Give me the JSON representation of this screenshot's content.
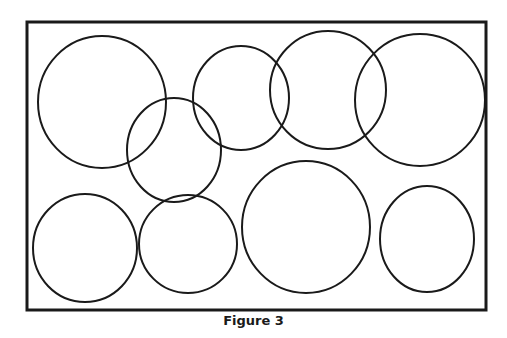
{
  "figure": {
    "caption": "Figure 3",
    "stroke_color": "#1a1a1a",
    "frame": {
      "x": 27,
      "y": 22,
      "width": 459,
      "height": 288,
      "stroke_width": 3
    },
    "circles": [
      {
        "cx": 102,
        "cy": 102,
        "rx": 64,
        "ry": 66
      },
      {
        "cx": 174,
        "cy": 150,
        "rx": 47,
        "ry": 52
      },
      {
        "cx": 241,
        "cy": 98,
        "rx": 48,
        "ry": 52
      },
      {
        "cx": 328,
        "cy": 90,
        "rx": 58,
        "ry": 59
      },
      {
        "cx": 420,
        "cy": 100,
        "rx": 65,
        "ry": 66
      },
      {
        "cx": 85,
        "cy": 248,
        "rx": 52,
        "ry": 54
      },
      {
        "cx": 188,
        "cy": 244,
        "rx": 49,
        "ry": 49
      },
      {
        "cx": 306,
        "cy": 227,
        "rx": 64,
        "ry": 66
      },
      {
        "cx": 427,
        "cy": 239,
        "rx": 47,
        "ry": 53
      }
    ]
  }
}
